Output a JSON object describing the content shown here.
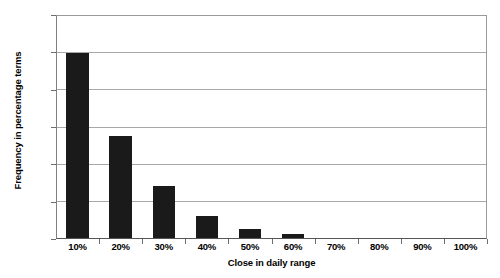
{
  "chart_data": {
    "type": "bar",
    "title": "",
    "subtitle": "",
    "xlabel": "Close in daily range",
    "ylabel": "Frequency in percentage terms",
    "categories": [
      "10%",
      "20%",
      "30%",
      "40%",
      "50%",
      "60%",
      "70%",
      "80%",
      "90%",
      "100%"
    ],
    "values": [
      50.0,
      27.7,
      14.0,
      6.0,
      2.5,
      1.0,
      0.0,
      0.0,
      0.0,
      0.0
    ],
    "series": [
      {
        "name": "Frequency",
        "values": [
          50.0,
          27.7,
          14.0,
          6.0,
          2.5,
          1.0,
          0.0,
          0.0,
          0.0,
          0.0
        ]
      }
    ],
    "ylim": [
      0,
      60
    ],
    "ytick_labels": [
      "0%",
      "10%",
      "20%",
      "30%",
      "40%",
      "50%",
      "60%"
    ],
    "ytick_values": [
      0,
      10,
      20,
      30,
      40,
      50,
      60
    ],
    "xtick_labels": [
      "10%",
      "20%",
      "30%",
      "40%",
      "50%",
      "60%",
      "70%",
      "80%",
      "90%",
      "100%"
    ],
    "grid": true,
    "grid_axis": "y",
    "legend": false,
    "legend_position": "none",
    "bar_color": "#1a1a1a",
    "gridline_color": "#a8a8a8",
    "axis_color": "#6e6e6e",
    "plot_background": "#ffffff"
  }
}
